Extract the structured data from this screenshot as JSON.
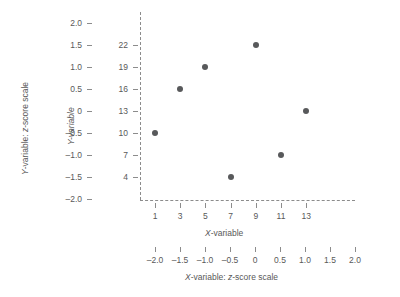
{
  "chart_data": {
    "type": "scatter",
    "title": "",
    "xlabel": "X-variable",
    "ylabel": "Y-variable",
    "x": [
      1,
      3,
      5,
      7,
      9,
      11,
      13
    ],
    "y": [
      10,
      16,
      19,
      4,
      22,
      7,
      13
    ],
    "points": [
      {
        "x": 1,
        "y": 10
      },
      {
        "x": 3,
        "y": 16
      },
      {
        "x": 5,
        "y": 19
      },
      {
        "x": 7,
        "y": 4
      },
      {
        "x": 9,
        "y": 22
      },
      {
        "x": 11,
        "y": 7
      },
      {
        "x": 13,
        "y": 13
      }
    ],
    "xlim": [
      0,
      14.5
    ],
    "ylim": [
      2.5,
      23.5
    ],
    "grid": false,
    "legend": null,
    "marker_color": "#58595b",
    "axis_color": "#8c8c8c",
    "axes": {
      "y_primary": {
        "label": "Y-variable",
        "ticks": [
          "22",
          "19",
          "16",
          "13",
          "10",
          "7",
          "4"
        ],
        "values": [
          22,
          19,
          16,
          13,
          10,
          7,
          4
        ]
      },
      "y_secondary": {
        "label": "Y-variable: z-score scale",
        "ticks": [
          "2.0",
          "1.5",
          "1.0",
          "0.5",
          "0",
          "–0.5",
          "–1.0",
          "–1.5",
          "–2.0"
        ],
        "values": [
          2.0,
          1.5,
          1.0,
          0.5,
          0,
          -0.5,
          -1.0,
          -1.5,
          -2.0
        ]
      },
      "x_primary": {
        "label": "X-variable",
        "ticks": [
          "1",
          "3",
          "5",
          "7",
          "9",
          "11",
          "13"
        ],
        "values": [
          1,
          3,
          5,
          7,
          9,
          11,
          13
        ]
      },
      "x_secondary": {
        "label": "X-variable: z-score scale",
        "ticks": [
          "–2.0",
          "–1.5",
          "–1.0",
          "–0.5",
          "0",
          "0.5",
          "1.0",
          "1.5",
          "2.0"
        ],
        "values": [
          -2.0,
          -1.5,
          -1.0,
          -0.5,
          0,
          0.5,
          1.0,
          1.5,
          2.0
        ]
      }
    }
  },
  "labels": {
    "y_primary_title": "Y-variable",
    "y_secondary_title": "Y-variable: z-score scale",
    "x_primary_title": "X-variable",
    "x_secondary_title": "X-variable: z-score scale",
    "y_primary_ticks": [
      "22",
      "19",
      "16",
      "13",
      "10",
      "7",
      "4"
    ],
    "y_secondary_ticks": [
      "2.0",
      "1.5",
      "1.0",
      "0.5",
      "0",
      "–0.5",
      "–1.0",
      "–1.5",
      "–2.0"
    ],
    "x_primary_ticks": [
      "1",
      "3",
      "5",
      "7",
      "9",
      "11",
      "13"
    ],
    "x_secondary_ticks": [
      "–2.0",
      "–1.5",
      "–1.0",
      "–0.5",
      "0",
      "0.5",
      "1.0",
      "1.5",
      "2.0"
    ]
  }
}
